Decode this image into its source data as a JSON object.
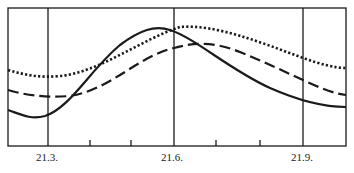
{
  "chart_data": {
    "type": "line",
    "title": "",
    "xlabel": "",
    "ylabel": "",
    "x_tick_labels": [
      "21.3.",
      "21.6.",
      "21.9."
    ],
    "x_major_ticks_px": [
      48,
      174,
      303
    ],
    "x_minor_ticks_px": [
      90,
      131,
      216,
      260
    ],
    "grid": "vertical lines at labeled dates",
    "legend": null,
    "series": [
      {
        "name": "solid",
        "style": "solid",
        "path": "M8,110 C20,114 30,120 45,116 C70,108 90,70 120,45 C140,30 155,25 170,30 C195,38 230,70 270,88 C295,99 320,107 346,107"
      },
      {
        "name": "dotted",
        "style": "dotted",
        "path": "M8,70 C25,75 40,78 60,76 C100,72 140,40 180,27 C215,24 260,42 303,58 C320,64 335,68 346,68"
      },
      {
        "name": "dashed",
        "style": "dashed",
        "path": "M8,90 C25,95 45,98 70,96 C110,90 140,55 174,48 C195,42 215,42 240,52 C265,62 285,72 303,80 C320,88 335,94 346,95"
      }
    ],
    "frame": {
      "left": 8,
      "top": 8,
      "right": 346,
      "bottom": 146
    }
  },
  "header": {
    "top_cut_text": ""
  }
}
